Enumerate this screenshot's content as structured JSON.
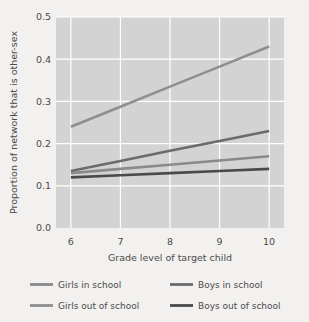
{
  "chart_data": {
    "type": "line",
    "title": "",
    "xlabel": "Grade level of target child",
    "ylabel": "Proportion of network that is other-sex",
    "x": [
      6,
      7,
      8,
      9,
      10
    ],
    "xlim": [
      5.7,
      10.3
    ],
    "ylim": [
      0.0,
      0.5
    ],
    "xticks": [
      6,
      7,
      8,
      9,
      10
    ],
    "xtick_labels": [
      "6",
      "7",
      "8",
      "9",
      "10"
    ],
    "yticks": [
      0.0,
      0.1,
      0.2,
      0.3,
      0.4,
      0.5
    ],
    "ytick_labels": [
      "0.0",
      "0.1",
      "0.2",
      "0.3",
      "0.4",
      "0.5"
    ],
    "grid": true,
    "grid_color": "#ffffff",
    "plot_background": "#d4d3d3",
    "figure_background": "#f2f1ef",
    "legend_position": "below",
    "legend_columns": 2,
    "series": [
      {
        "name": "Girls in school",
        "color": "#8a8a8a",
        "values": [
          0.13,
          0.14,
          0.15,
          0.16,
          0.17
        ]
      },
      {
        "name": "Boys in school",
        "color": "#6b6b6b",
        "values": [
          0.135,
          0.159,
          0.183,
          0.206,
          0.23
        ]
      },
      {
        "name": "Girls out of school",
        "color": "#8f8f8f",
        "values": [
          0.24,
          0.2875,
          0.335,
          0.3825,
          0.43
        ]
      },
      {
        "name": "Boys out of school",
        "color": "#4a4a4a",
        "values": [
          0.12,
          0.125,
          0.13,
          0.135,
          0.14
        ]
      }
    ]
  },
  "legend": {
    "entries": [
      {
        "label": "Girls in school",
        "color": "#8a8a8a"
      },
      {
        "label": "Boys in school",
        "color": "#6b6b6b"
      },
      {
        "label": "Girls out of school",
        "color": "#8f8f8f"
      },
      {
        "label": "Boys out of school",
        "color": "#4a4a4a"
      }
    ]
  }
}
